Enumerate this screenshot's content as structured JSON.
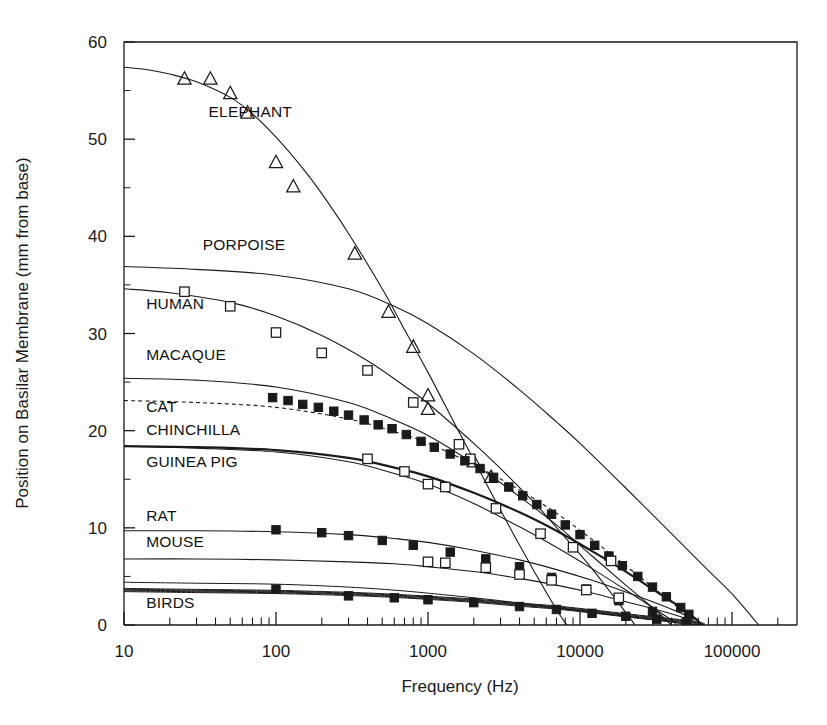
{
  "figure": {
    "background_color": "#ffffff",
    "line_color": "#1a1a1a",
    "plot_frame": {
      "left": 124,
      "right": 797,
      "top": 42,
      "bottom": 625
    }
  },
  "chart_data": {
    "type": "scatter",
    "title": "",
    "xlabel": "Frequency (Hz)",
    "ylabel": "Position on Basilar Membrane (mm from base)",
    "xscale": "log",
    "yscale": "linear",
    "xlim": [
      10,
      200000
    ],
    "ylim": [
      0,
      60
    ],
    "grid": false,
    "legend": "inline-labels",
    "x_tick_labels": [
      "10",
      "100",
      "1000",
      "10000",
      "100000"
    ],
    "x_tick_values": [
      10,
      100,
      1000,
      10000,
      100000
    ],
    "y_tick_labels": [
      "0",
      "10",
      "20",
      "30",
      "40",
      "50",
      "60"
    ],
    "y_tick_values": [
      0,
      10,
      20,
      30,
      40,
      50,
      60
    ],
    "minor_ticks": "log decades (2..9)",
    "series": [
      {
        "name": "ELEPHANT",
        "label": "ELEPHANT",
        "label_pos": {
          "x": 36,
          "y": 52.3
        },
        "marker": "open-triangle",
        "curve_style": "solid",
        "curve_width": 1.1,
        "curve": [
          [
            10,
            57.4
          ],
          [
            15,
            57.1
          ],
          [
            20,
            56.7
          ],
          [
            30,
            55.9
          ],
          [
            50,
            54.3
          ],
          [
            70,
            52.6
          ],
          [
            100,
            50.2
          ],
          [
            150,
            47.0
          ],
          [
            200,
            44.4
          ],
          [
            300,
            40.3
          ],
          [
            500,
            34.6
          ],
          [
            700,
            30.4
          ],
          [
            1000,
            26.0
          ],
          [
            1500,
            20.7
          ],
          [
            2000,
            17.0
          ],
          [
            3000,
            11.8
          ],
          [
            5000,
            5.5
          ],
          [
            7000,
            1.6
          ],
          [
            8200,
            0
          ]
        ],
        "points": [
          [
            25,
            56.2
          ],
          [
            37,
            56.2
          ],
          [
            50,
            54.7
          ],
          [
            65,
            52.7
          ],
          [
            100,
            47.6
          ],
          [
            130,
            45.1
          ],
          [
            330,
            38.2
          ],
          [
            550,
            32.2
          ],
          [
            800,
            28.6
          ],
          [
            1000,
            23.6
          ],
          [
            1000,
            22.2
          ],
          [
            2000,
            16.8
          ],
          [
            2600,
            15.2
          ]
        ]
      },
      {
        "name": "PORPOISE",
        "label": "PORPOISE",
        "label_pos": {
          "x": 33,
          "y": 38.6
        },
        "marker": "none",
        "curve_style": "solid",
        "curve_width": 1.1,
        "curve": [
          [
            10,
            36.9
          ],
          [
            30,
            36.6
          ],
          [
            100,
            36.0
          ],
          [
            300,
            34.6
          ],
          [
            600,
            32.8
          ],
          [
            1000,
            31.0
          ],
          [
            2000,
            27.9
          ],
          [
            4000,
            24.2
          ],
          [
            7000,
            20.9
          ],
          [
            10000,
            18.7
          ],
          [
            20000,
            14.1
          ],
          [
            40000,
            9.4
          ],
          [
            70000,
            5.6
          ],
          [
            100000,
            3.2
          ],
          [
            150000,
            0.0
          ]
        ],
        "points": []
      },
      {
        "name": "HUMAN",
        "label": "HUMAN",
        "label_pos": {
          "x": 14,
          "y": 32.5
        },
        "marker": "open-square",
        "curve_style": "solid",
        "curve_width": 1.1,
        "curve": [
          [
            10,
            34.6
          ],
          [
            20,
            34.2
          ],
          [
            50,
            33.2
          ],
          [
            100,
            31.8
          ],
          [
            200,
            29.8
          ],
          [
            400,
            27.2
          ],
          [
            700,
            24.6
          ],
          [
            1000,
            22.8
          ],
          [
            2000,
            18.7
          ],
          [
            3000,
            16.1
          ],
          [
            5000,
            12.6
          ],
          [
            8000,
            9.0
          ],
          [
            12000,
            5.8
          ],
          [
            20000,
            1.3
          ],
          [
            23000,
            0.0
          ]
        ],
        "points": [
          [
            25,
            34.3
          ],
          [
            50,
            32.8
          ],
          [
            100,
            30.1
          ],
          [
            200,
            28.0
          ],
          [
            400,
            26.2
          ],
          [
            800,
            22.9
          ],
          [
            1600,
            18.6
          ],
          [
            1900,
            17.1
          ]
        ]
      },
      {
        "name": "MACAQUE",
        "label": "MACAQUE",
        "label_pos": {
          "x": 14,
          "y": 27.3
        },
        "marker": "none",
        "curve_style": "solid",
        "curve_width": 1.1,
        "curve": [
          [
            10,
            25.4
          ],
          [
            30,
            25.2
          ],
          [
            100,
            24.5
          ],
          [
            300,
            22.9
          ],
          [
            600,
            21.1
          ],
          [
            1000,
            19.5
          ],
          [
            2000,
            16.6
          ],
          [
            4000,
            13.2
          ],
          [
            7000,
            10.3
          ],
          [
            12000,
            7.1
          ],
          [
            20000,
            4.1
          ],
          [
            30000,
            1.8
          ],
          [
            40000,
            0.0
          ]
        ],
        "points": []
      },
      {
        "name": "CAT",
        "label": "CAT",
        "label_pos": {
          "x": 14,
          "y": 21.9
        },
        "marker": "none",
        "curve_style": "dashed",
        "curve_width": 1.1,
        "curve": [
          [
            10,
            23.1
          ],
          [
            30,
            22.9
          ],
          [
            100,
            22.4
          ],
          [
            300,
            21.2
          ],
          [
            600,
            19.9
          ],
          [
            1000,
            18.7
          ],
          [
            2000,
            16.5
          ],
          [
            4000,
            13.9
          ],
          [
            7000,
            11.5
          ],
          [
            12000,
            8.8
          ],
          [
            20000,
            6.1
          ],
          [
            30000,
            3.9
          ],
          [
            45000,
            1.7
          ],
          [
            55000,
            0.5
          ],
          [
            58000,
            0.0
          ]
        ],
        "points": []
      },
      {
        "name": "CHINCHILLA",
        "label": "CHINCHILLA",
        "label_pos": {
          "x": 14,
          "y": 19.6
        },
        "marker": "filled-square",
        "curve_style": "solid",
        "curve_width": 2.2,
        "curve": [
          [
            10,
            18.4
          ],
          [
            30,
            18.3
          ],
          [
            100,
            18.0
          ],
          [
            300,
            17.2
          ],
          [
            600,
            16.2
          ],
          [
            1000,
            15.3
          ],
          [
            2000,
            13.6
          ],
          [
            4000,
            11.6
          ],
          [
            7000,
            9.7
          ],
          [
            12000,
            7.6
          ],
          [
            20000,
            5.5
          ],
          [
            30000,
            3.7
          ],
          [
            45000,
            1.9
          ],
          [
            58000,
            0.6
          ],
          [
            62000,
            0.0
          ]
        ],
        "points": [
          [
            95,
            23.4
          ],
          [
            120,
            23.1
          ],
          [
            150,
            22.7
          ],
          [
            190,
            22.4
          ],
          [
            240,
            22.0
          ],
          [
            300,
            21.6
          ],
          [
            380,
            21.1
          ],
          [
            470,
            20.6
          ],
          [
            580,
            20.2
          ],
          [
            720,
            19.6
          ],
          [
            900,
            18.9
          ],
          [
            1100,
            18.3
          ],
          [
            1400,
            17.6
          ],
          [
            1750,
            16.9
          ],
          [
            2200,
            16.1
          ],
          [
            2700,
            15.2
          ],
          [
            3400,
            14.2
          ],
          [
            4200,
            13.3
          ],
          [
            5200,
            12.4
          ],
          [
            6500,
            11.4
          ],
          [
            8000,
            10.3
          ],
          [
            10000,
            9.3
          ],
          [
            12500,
            8.2
          ],
          [
            15500,
            7.1
          ],
          [
            19000,
            6.1
          ],
          [
            24000,
            5.0
          ],
          [
            30000,
            3.9
          ],
          [
            37000,
            2.9
          ],
          [
            46000,
            1.8
          ],
          [
            52000,
            1.1
          ]
        ]
      },
      {
        "name": "GUINEA PIG",
        "label": "GUINEA PIG",
        "label_pos": {
          "x": 14,
          "y": 16.3
        },
        "marker": "open-square",
        "curve_style": "solid",
        "curve_width": 1.1,
        "curve": [
          [
            10,
            18.4
          ],
          [
            30,
            18.2
          ],
          [
            100,
            17.8
          ],
          [
            300,
            16.8
          ],
          [
            600,
            15.6
          ],
          [
            1000,
            14.5
          ],
          [
            2000,
            12.5
          ],
          [
            4000,
            10.1
          ],
          [
            7000,
            8.0
          ],
          [
            12000,
            5.8
          ],
          [
            20000,
            3.6
          ],
          [
            30000,
            1.8
          ],
          [
            40000,
            0.5
          ],
          [
            43000,
            0.0
          ]
        ],
        "points": [
          [
            400,
            17.1
          ],
          [
            700,
            15.8
          ],
          [
            1000,
            14.5
          ],
          [
            1300,
            14.2
          ],
          [
            2800,
            12.0
          ],
          [
            5500,
            9.4
          ],
          [
            9000,
            8.0
          ],
          [
            16000,
            6.6
          ]
        ]
      },
      {
        "name": "RAT",
        "label": "RAT",
        "label_pos": {
          "x": 14,
          "y": 10.7
        },
        "marker": "filled-square",
        "curve_style": "solid",
        "curve_width": 1.1,
        "curve": [
          [
            10,
            9.7
          ],
          [
            30,
            9.7
          ],
          [
            100,
            9.6
          ],
          [
            300,
            9.3
          ],
          [
            600,
            8.9
          ],
          [
            1000,
            8.5
          ],
          [
            2000,
            7.7
          ],
          [
            4000,
            6.7
          ],
          [
            7000,
            5.7
          ],
          [
            12000,
            4.6
          ],
          [
            20000,
            3.4
          ],
          [
            30000,
            2.4
          ],
          [
            45000,
            1.3
          ],
          [
            60000,
            0.4
          ],
          [
            65000,
            0.0
          ]
        ],
        "points": [
          [
            100,
            9.8
          ],
          [
            200,
            9.5
          ],
          [
            300,
            9.2
          ],
          [
            500,
            8.7
          ],
          [
            800,
            8.2
          ],
          [
            1400,
            7.5
          ],
          [
            2400,
            6.8
          ],
          [
            4000,
            6.0
          ],
          [
            6500,
            4.9
          ],
          [
            11000,
            3.7
          ],
          [
            18000,
            2.5
          ],
          [
            30000,
            1.4
          ]
        ]
      },
      {
        "name": "MOUSE",
        "label": "MOUSE",
        "label_pos": {
          "x": 14,
          "y": 8.0
        },
        "marker": "open-square",
        "curve_style": "solid",
        "curve_width": 1.1,
        "curve": [
          [
            10,
            6.8
          ],
          [
            30,
            6.8
          ],
          [
            100,
            6.7
          ],
          [
            300,
            6.5
          ],
          [
            600,
            6.3
          ],
          [
            1000,
            6.0
          ],
          [
            2000,
            5.5
          ],
          [
            4000,
            4.8
          ],
          [
            7000,
            4.1
          ],
          [
            12000,
            3.3
          ],
          [
            20000,
            2.4
          ],
          [
            30000,
            1.7
          ],
          [
            45000,
            0.9
          ],
          [
            60000,
            0.2
          ],
          [
            64000,
            0.0
          ]
        ],
        "points": [
          [
            1000,
            6.5
          ],
          [
            1300,
            6.4
          ],
          [
            2400,
            5.9
          ],
          [
            4000,
            5.2
          ],
          [
            6500,
            4.6
          ],
          [
            11000,
            3.6
          ],
          [
            18000,
            2.8
          ]
        ]
      },
      {
        "name": "BIRDS",
        "label": "BIRDS",
        "label_pos": {
          "x": 14,
          "y": 1.7
        },
        "marker": "filled-square",
        "curve_style": "solid-bundle",
        "curve_width": 1.0,
        "bundle_count": 5,
        "curve": [
          [
            10,
            3.6
          ],
          [
            30,
            3.5
          ],
          [
            100,
            3.4
          ],
          [
            300,
            3.2
          ],
          [
            600,
            3.0
          ],
          [
            1000,
            2.8
          ],
          [
            2000,
            2.5
          ],
          [
            4000,
            2.1
          ],
          [
            7000,
            1.8
          ],
          [
            12000,
            1.4
          ],
          [
            20000,
            1.0
          ],
          [
            30000,
            0.7
          ],
          [
            45000,
            0.4
          ],
          [
            60000,
            0.1
          ],
          [
            66000,
            0.0
          ]
        ],
        "extra_curve": [
          [
            10,
            4.4
          ],
          [
            30,
            4.3
          ],
          [
            100,
            4.2
          ],
          [
            300,
            3.9
          ],
          [
            700,
            3.5
          ],
          [
            1500,
            3.0
          ],
          [
            3000,
            2.5
          ],
          [
            6000,
            1.9
          ],
          [
            12000,
            1.3
          ],
          [
            22000,
            0.8
          ],
          [
            40000,
            0.3
          ],
          [
            50000,
            0.0
          ]
        ],
        "points": [
          [
            100,
            3.7
          ],
          [
            300,
            3.0
          ],
          [
            600,
            2.8
          ],
          [
            1000,
            2.6
          ],
          [
            2000,
            2.3
          ],
          [
            4000,
            1.9
          ],
          [
            7000,
            1.6
          ],
          [
            12000,
            1.2
          ],
          [
            20000,
            0.9
          ],
          [
            32000,
            0.6
          ],
          [
            50000,
            0.3
          ]
        ]
      }
    ]
  }
}
